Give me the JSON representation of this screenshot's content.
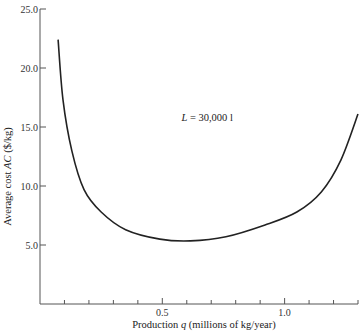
{
  "chart_data": {
    "type": "line",
    "title": "",
    "xlabel": "Production q (millions of kg/year)",
    "xlabel_parts": {
      "pre": "Production ",
      "var": "q",
      "post": " (millions of kg/year)"
    },
    "ylabel": "Average cost AC ($/kg)",
    "ylabel_parts": {
      "pre": "Average cost ",
      "var": "AC",
      "post": " ($/kg)"
    },
    "xlim": [
      0,
      1.3
    ],
    "ylim": [
      0,
      25
    ],
    "x_ticks": [
      0.1,
      0.2,
      0.3,
      0.4,
      0.5,
      0.6,
      0.7,
      0.8,
      0.9,
      1.0,
      1.1,
      1.2,
      1.3
    ],
    "x_tick_labels": [
      {
        "value": 0.5,
        "label": "0.5"
      },
      {
        "value": 1.0,
        "label": "1.0"
      }
    ],
    "y_ticks": [
      {
        "value": 5,
        "label": "5.0"
      },
      {
        "value": 10,
        "label": "10.0"
      },
      {
        "value": 15,
        "label": "15.0"
      },
      {
        "value": 20,
        "label": "20.0"
      },
      {
        "value": 25,
        "label": "25.0"
      }
    ],
    "grid": false,
    "legend": null,
    "annotations": [
      {
        "text_pre": "L",
        "text_post": " = 30,000 l",
        "x": 0.66,
        "y": 15.5
      }
    ],
    "series": [
      {
        "name": "AC (L = 30,000 l)",
        "color": "#222222",
        "x": [
          0.074,
          0.094,
          0.13,
          0.18,
          0.25,
          0.35,
          0.49,
          0.615,
          0.76,
          0.92,
          1.05,
          1.15,
          1.23,
          1.3
        ],
        "y": [
          22.4,
          17.3,
          13.0,
          9.7,
          7.8,
          6.3,
          5.5,
          5.35,
          5.7,
          6.7,
          7.8,
          9.5,
          12.2,
          16.1
        ]
      }
    ]
  },
  "colors": {
    "axis": "#555555",
    "curve": "#222222",
    "background": "#ffffff"
  }
}
